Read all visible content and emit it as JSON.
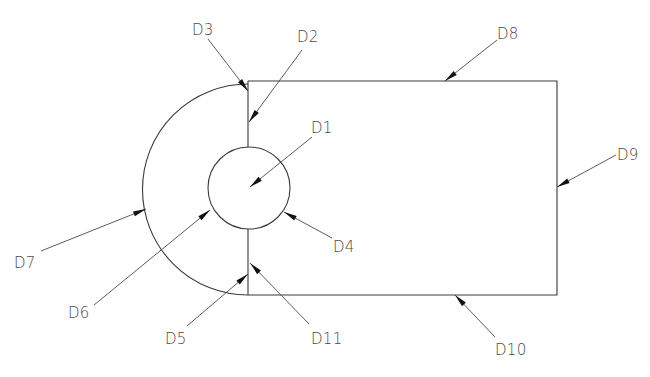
{
  "diagram": {
    "type": "engineering-drawing",
    "colors": {
      "line": "#3a3a3a",
      "arrow": "#111111",
      "label": "#4a4a4a"
    },
    "shapes": [
      {
        "id": "circle",
        "kind": "circle",
        "label": "D1 / D4 / D6"
      },
      {
        "id": "outer-arc",
        "kind": "semicircle-left",
        "label": "D7"
      },
      {
        "id": "rectangle",
        "kind": "rectangle",
        "label": "D8 / D9 / D10"
      },
      {
        "id": "slit-top",
        "kind": "vertical-line",
        "label": "D2 / D3"
      },
      {
        "id": "slit-bottom",
        "kind": "vertical-line",
        "label": "D5 / D11"
      }
    ],
    "labels": [
      {
        "id": "D1",
        "text": "D1",
        "target": "circle interior"
      },
      {
        "id": "D2",
        "text": "D2",
        "target": "upper slit line"
      },
      {
        "id": "D3",
        "text": "D3",
        "target": "upper-left corner"
      },
      {
        "id": "D4",
        "text": "D4",
        "target": "circle edge (right)"
      },
      {
        "id": "D5",
        "text": "D5",
        "target": "lower slit line (left side)"
      },
      {
        "id": "D6",
        "text": "D6",
        "target": "circle edge (left)"
      },
      {
        "id": "D7",
        "text": "D7",
        "target": "outer arc"
      },
      {
        "id": "D8",
        "text": "D8",
        "target": "rectangle top edge"
      },
      {
        "id": "D9",
        "text": "D9",
        "target": "rectangle right edge"
      },
      {
        "id": "D10",
        "text": "D10",
        "target": "rectangle bottom edge"
      },
      {
        "id": "D11",
        "text": "D11",
        "target": "lower slit line (right side)"
      }
    ]
  }
}
